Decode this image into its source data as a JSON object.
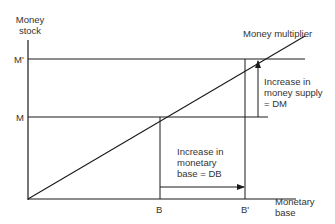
{
  "diagram": {
    "y_axis_label_line1": "Money",
    "y_axis_label_line2": "stock",
    "x_axis_label_line1": "Monetary",
    "x_axis_label_line2": "base",
    "curve_label": "Money multiplier",
    "y_ticks": {
      "m_prime": "M'",
      "m": "M"
    },
    "x_ticks": {
      "b": "B",
      "b_prime": "B'"
    },
    "money_supply_annotation": {
      "line1": "Increase in",
      "line2": "money supply",
      "line3": "= DM"
    },
    "monetary_base_annotation": {
      "line1": "Increase in",
      "line2": "monetary",
      "line3": "base = DB"
    },
    "colors": {
      "line": "#1a1a1a",
      "text": "#333333",
      "background": "#ffffff"
    }
  }
}
